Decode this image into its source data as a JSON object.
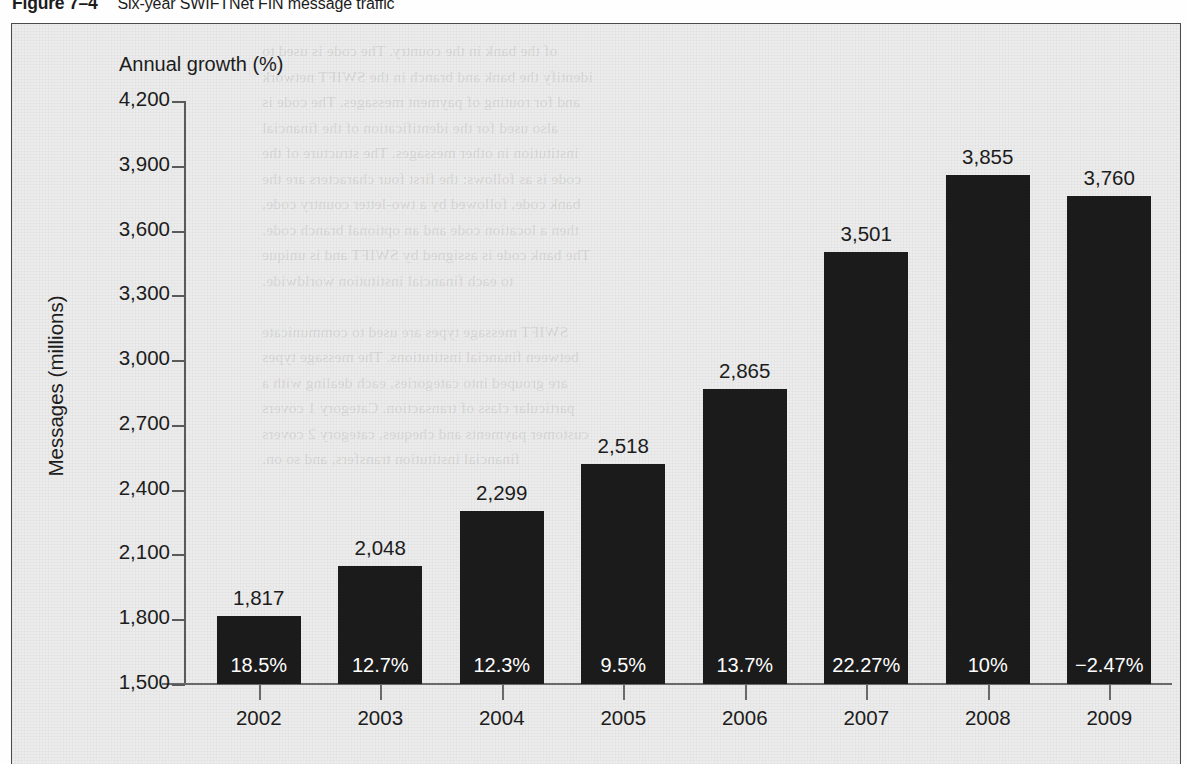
{
  "caption": {
    "figure_number": "Figure 7–4",
    "title": "Six-year SWIFTNet FIN message traffic"
  },
  "colors": {
    "bar": "#1b1b1b",
    "axis": "#5a5a5a",
    "text": "#1c1c1c",
    "background": "#ececec",
    "pct_label": "#ffffff"
  },
  "ghost_text": [
    "of the bank in the country. The code is used to",
    "identify the bank and branch in the SWIFT network",
    "and for routing of payment messages. The code is",
    "also used for the identification of the financial",
    "institution in other messages. The structure of the",
    "code is as follows: the first four characters are the",
    "bank code, followed by a two-letter country code,",
    "then a location code and an optional branch code.",
    "The bank code is assigned by SWIFT and is unique",
    "to each financial institution worldwide.",
    "",
    "SWIFT message types are used to communicate",
    "between financial institutions. The message types",
    "are grouped into categories, each dealing with a",
    "particular class of transaction. Category 1 covers",
    "customer payments and cheques, category 2 covers",
    "financial institution transfers, and so on."
  ],
  "chart_data": {
    "type": "bar",
    "title": "Six-year SWIFTNet FIN message traffic",
    "xlabel": "",
    "ylabel": "Messages (millions)",
    "secondary_note": "Annual growth (%)",
    "ylim": [
      1500,
      4200
    ],
    "yticks": [
      "4,200",
      "3,900",
      "3,600",
      "3,300",
      "3,000",
      "2,700",
      "2,400",
      "2,100",
      "1,800",
      "1,500"
    ],
    "ytick_values": [
      4200,
      3900,
      3600,
      3300,
      3000,
      2700,
      2400,
      2100,
      1800,
      1500
    ],
    "grid": false,
    "legend": "none",
    "categories": [
      "2002",
      "2003",
      "2004",
      "2005",
      "2006",
      "2007",
      "2008",
      "2009"
    ],
    "values": [
      1817,
      2048,
      2299,
      2518,
      2865,
      3501,
      3855,
      3760
    ],
    "value_labels": [
      "1,817",
      "2,048",
      "2,299",
      "2,518",
      "2,865",
      "3,501",
      "3,855",
      "3,760"
    ],
    "growth_values": [
      18.5,
      12.7,
      12.3,
      9.5,
      13.7,
      22.27,
      10,
      -2.47
    ],
    "growth_labels": [
      "18.5%",
      "12.7%",
      "12.3%",
      "9.5%",
      "13.7%",
      "22.27%",
      "10%",
      "−2.47%"
    ]
  }
}
